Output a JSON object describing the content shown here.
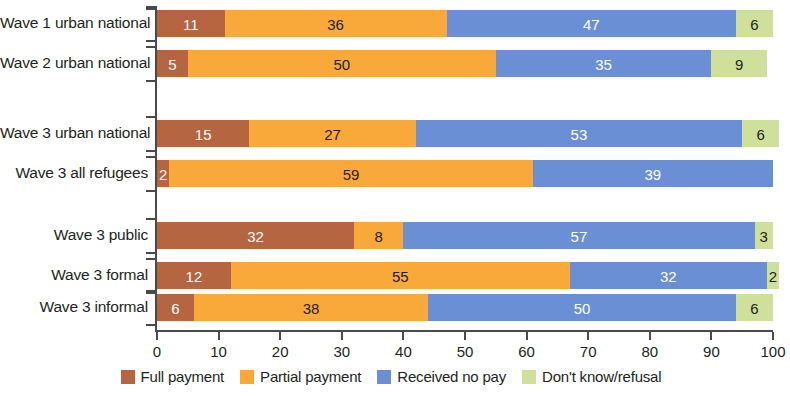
{
  "chart_data": {
    "type": "bar",
    "orientation": "horizontal",
    "stacked": true,
    "stack_mode": "percent",
    "title": "",
    "xlabel": "",
    "ylabel": "",
    "xlim": [
      0,
      100
    ],
    "xticks": [
      0,
      10,
      20,
      30,
      40,
      50,
      60,
      70,
      80,
      90,
      100
    ],
    "xtick_labels": [
      "0",
      "10",
      "20",
      "30",
      "40",
      "50",
      "60",
      "70",
      "80",
      "90",
      "100"
    ],
    "grid": false,
    "legend_position": "bottom",
    "categories": [
      "Wave 1 urban national",
      "Wave 2 urban national",
      "Wave 3 urban national",
      "Wave 3 all refugees",
      "Wave 3 public",
      "Wave 3 formal",
      "Wave 3 informal"
    ],
    "groups": [
      {
        "name": "group-1",
        "categories": [
          "Wave 1 urban national",
          "Wave 2 urban national"
        ]
      },
      {
        "name": "group-2",
        "categories": [
          "Wave 3 urban national",
          "Wave 3 all refugees"
        ]
      },
      {
        "name": "group-3",
        "categories": [
          "Wave 3 public",
          "Wave 3 formal",
          "Wave 3 informal"
        ]
      }
    ],
    "series": [
      {
        "name": "Full payment",
        "color": "#b5653f",
        "values": [
          11,
          5,
          15,
          2,
          32,
          12,
          6
        ]
      },
      {
        "name": "Partial payment",
        "color": "#f9a93a",
        "values": [
          36,
          50,
          27,
          59,
          8,
          55,
          38
        ]
      },
      {
        "name": "Received no pay",
        "color": "#6b8fd4",
        "values": [
          47,
          35,
          53,
          39,
          57,
          32,
          50
        ]
      },
      {
        "name": "Don't know/refusal",
        "color": "#cfe09a",
        "values": [
          6,
          9,
          6,
          0,
          3,
          2,
          6
        ]
      }
    ],
    "bars": [
      {
        "label": "Wave 1 urban national",
        "group": 0,
        "segments": [
          {
            "series": "Full payment",
            "value": 11,
            "text": "11",
            "text_color": "light"
          },
          {
            "series": "Partial payment",
            "value": 36,
            "text": "36",
            "text_color": "dark"
          },
          {
            "series": "Received no pay",
            "value": 47,
            "text": "47",
            "text_color": "light"
          },
          {
            "series": "Don't know/refusal",
            "value": 6,
            "text": "6",
            "text_color": "dark"
          }
        ]
      },
      {
        "label": "Wave 2 urban national",
        "group": 0,
        "segments": [
          {
            "series": "Full payment",
            "value": 5,
            "text": "5",
            "text_color": "light"
          },
          {
            "series": "Partial payment",
            "value": 50,
            "text": "50",
            "text_color": "dark"
          },
          {
            "series": "Received no pay",
            "value": 35,
            "text": "35",
            "text_color": "light"
          },
          {
            "series": "Don't know/refusal",
            "value": 9,
            "text": "9",
            "text_color": "dark"
          }
        ]
      },
      {
        "label": "Wave 3 urban national",
        "group": 1,
        "segments": [
          {
            "series": "Full payment",
            "value": 15,
            "text": "15",
            "text_color": "light"
          },
          {
            "series": "Partial payment",
            "value": 27,
            "text": "27",
            "text_color": "dark"
          },
          {
            "series": "Received no pay",
            "value": 53,
            "text": "53",
            "text_color": "light"
          },
          {
            "series": "Don't know/refusal",
            "value": 6,
            "text": "6",
            "text_color": "dark"
          }
        ]
      },
      {
        "label": "Wave 3 all refugees",
        "group": 1,
        "segments": [
          {
            "series": "Full payment",
            "value": 2,
            "text": "2",
            "text_color": "light"
          },
          {
            "series": "Partial payment",
            "value": 59,
            "text": "59",
            "text_color": "dark"
          },
          {
            "series": "Received no pay",
            "value": 39,
            "text": "39",
            "text_color": "light"
          },
          {
            "series": "Don't know/refusal",
            "value": 0,
            "text": "",
            "text_color": "dark"
          }
        ]
      },
      {
        "label": "Wave 3 public",
        "group": 2,
        "segments": [
          {
            "series": "Full payment",
            "value": 32,
            "text": "32",
            "text_color": "light"
          },
          {
            "series": "Partial payment",
            "value": 8,
            "text": "8",
            "text_color": "dark"
          },
          {
            "series": "Received no pay",
            "value": 57,
            "text": "57",
            "text_color": "light"
          },
          {
            "series": "Don't know/refusal",
            "value": 3,
            "text": "3",
            "text_color": "dark"
          }
        ]
      },
      {
        "label": "Wave 3 formal",
        "group": 2,
        "segments": [
          {
            "series": "Full payment",
            "value": 12,
            "text": "12",
            "text_color": "light"
          },
          {
            "series": "Partial payment",
            "value": 55,
            "text": "55",
            "text_color": "dark"
          },
          {
            "series": "Received no pay",
            "value": 32,
            "text": "32",
            "text_color": "light"
          },
          {
            "series": "Don't know/refusal",
            "value": 2,
            "text": "2",
            "text_color": "dark"
          }
        ]
      },
      {
        "label": "Wave 3 informal",
        "group": 2,
        "segments": [
          {
            "series": "Full payment",
            "value": 6,
            "text": "6",
            "text_color": "light"
          },
          {
            "series": "Partial payment",
            "value": 38,
            "text": "38",
            "text_color": "dark"
          },
          {
            "series": "Received no pay",
            "value": 50,
            "text": "50",
            "text_color": "light"
          },
          {
            "series": "Don't know/refusal",
            "value": 6,
            "text": "6",
            "text_color": "dark"
          }
        ]
      }
    ]
  },
  "legend": {
    "items": [
      {
        "label": "Full payment",
        "color": "#b5653f"
      },
      {
        "label": "Partial payment",
        "color": "#f9a93a"
      },
      {
        "label": "Received no pay",
        "color": "#6b8fd4"
      },
      {
        "label": "Don't know/refusal",
        "color": "#cfe09a"
      }
    ]
  },
  "colors": {
    "full_payment": "#b5653f",
    "partial_payment": "#f9a93a",
    "received_no_pay": "#6b8fd4",
    "dont_know_refusal": "#cfe09a",
    "axis": "#4a4a4a",
    "text": "#231f20",
    "background": "#ffffff"
  }
}
